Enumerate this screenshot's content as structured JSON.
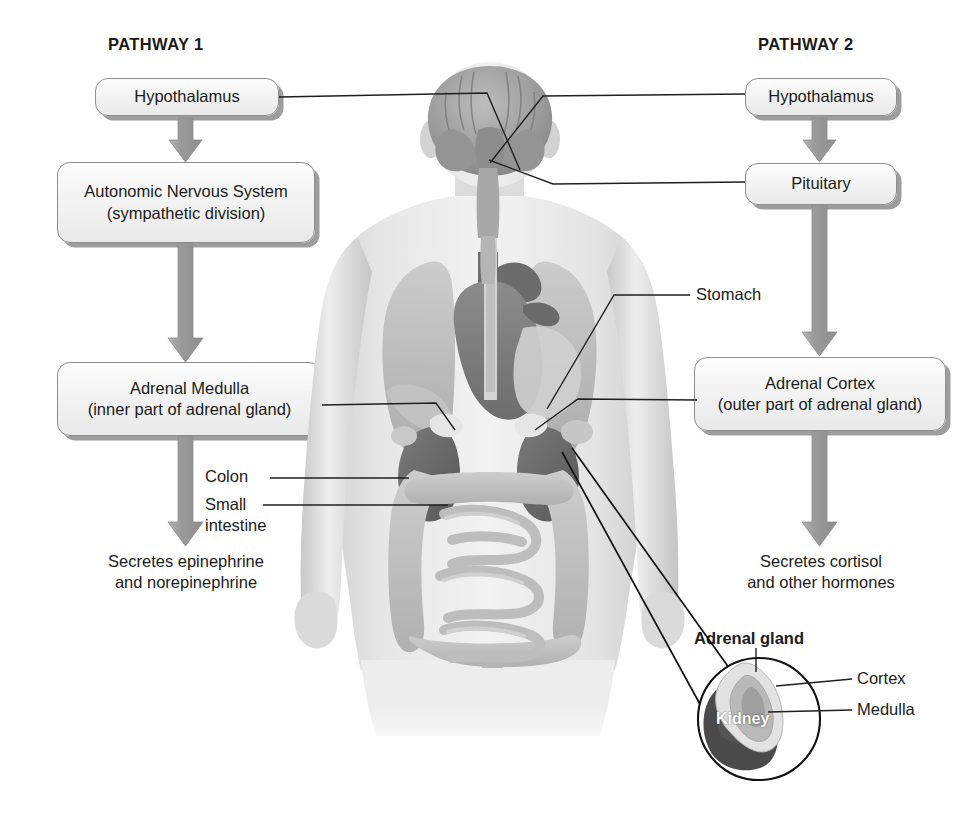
{
  "figure": {
    "background_color": "#ffffff",
    "box_fill": "#f1f1f1",
    "box_border": "#8e8e8e",
    "arrow_color": "#9a9a9a",
    "leader_color": "#1a1a1a"
  },
  "pathways": {
    "left": {
      "heading": "PATHWAY 1",
      "steps": [
        {
          "line1": "Hypothalamus",
          "line2": ""
        },
        {
          "line1": "Autonomic Nervous System",
          "line2": "(sympathetic division)"
        },
        {
          "line1": "Adrenal Medulla",
          "line2": "(inner part of adrenal gland)"
        }
      ],
      "outcome": {
        "line1": "Secretes epinephrine",
        "line2": "and norepinephrine"
      }
    },
    "right": {
      "heading": "PATHWAY 2",
      "steps": [
        {
          "line1": "Hypothalamus",
          "line2": ""
        },
        {
          "line1": "Pituitary",
          "line2": ""
        },
        {
          "line1": "Adrenal Cortex",
          "line2": "(outer part of adrenal gland)"
        }
      ],
      "outcome": {
        "line1": "Secretes cortisol",
        "line2": "and other hormones"
      }
    }
  },
  "anatomy_labels": {
    "stomach": "Stomach",
    "colon": "Colon",
    "small_intestine_line1": "Small",
    "small_intestine_line2": "intestine"
  },
  "inset": {
    "title": "Adrenal gland",
    "cortex": "Cortex",
    "medulla": "Medulla",
    "kidney": "Kidney"
  }
}
